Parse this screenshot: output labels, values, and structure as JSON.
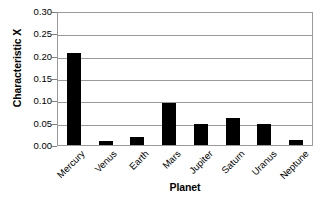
{
  "chart_data": {
    "type": "bar",
    "title": "",
    "xlabel": "Planet",
    "ylabel": "Characteristic X",
    "categories": [
      "Mercury",
      "Venus",
      "Earth",
      "Mars",
      "Jupiter",
      "Saturn",
      "Uranus",
      "Neptune"
    ],
    "values": [
      0.207,
      0.008,
      0.018,
      0.094,
      0.048,
      0.06,
      0.047,
      0.012
    ],
    "ylim": [
      0.0,
      0.3
    ],
    "ytick_values": [
      0.0,
      0.05,
      0.1,
      0.15,
      0.2,
      0.25,
      0.3
    ],
    "ytick_labels": [
      "0.00",
      "0.05",
      "0.10",
      "0.15",
      "0.20",
      "0.25",
      "0.30"
    ],
    "grid": true,
    "grid_axis": "y",
    "legend": false,
    "legend_position": "none",
    "bar_color": "#000000",
    "plot_background": "#ffffff",
    "axis_color": "#9a9a9a",
    "text_color": "#000000",
    "xtick_rotation": -45
  }
}
